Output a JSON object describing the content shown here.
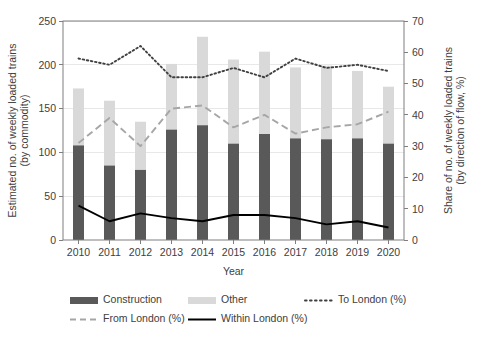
{
  "chart_data": {
    "type": "bar",
    "title": "",
    "subtitle": "",
    "xlabel": "Year",
    "ylabel": "Estimated no. of weekly loaded trains\n(by commodity)",
    "ylabel_line1": "Estimated no. of weekly loaded trains",
    "ylabel_line2": "(by commodity)",
    "y2label_line1": "Share of no. of weekly loaded trains",
    "y2label_line2": "(by direction of flow, %)",
    "categories": [
      "2010",
      "2011",
      "2012",
      "2013",
      "2014",
      "2015",
      "2016",
      "2017",
      "2018",
      "2019",
      "2020"
    ],
    "ylim": [
      0,
      250
    ],
    "yticks": [
      0,
      50,
      100,
      150,
      200,
      250
    ],
    "y2lim": [
      0,
      70
    ],
    "y2ticks": [
      0,
      10,
      20,
      30,
      40,
      50,
      60,
      70
    ],
    "grid": true,
    "legend_position": "bottom",
    "stacked": true,
    "series": [
      {
        "name": "Construction",
        "axis": "left",
        "kind": "bar",
        "color": "#595959",
        "values": [
          108,
          85,
          80,
          126,
          131,
          110,
          121,
          116,
          115,
          116,
          110
        ]
      },
      {
        "name": "Other",
        "axis": "left",
        "kind": "bar",
        "color": "#d9d9d9",
        "values": [
          65,
          74,
          55,
          75,
          101,
          96,
          94,
          81,
          84,
          77,
          65
        ]
      },
      {
        "name": "To London (%)",
        "axis": "right",
        "kind": "line",
        "style": "dotted",
        "color": "#404040",
        "values": [
          58,
          56,
          62,
          52,
          52,
          55,
          52,
          58,
          55,
          56,
          54
        ]
      },
      {
        "name": "From London (%)",
        "axis": "right",
        "kind": "line",
        "style": "dashed",
        "color": "#a6a6a6",
        "values": [
          31,
          39,
          30,
          42,
          43,
          36,
          40,
          34,
          36,
          37,
          41
        ]
      },
      {
        "name": "Within London (%)",
        "axis": "right",
        "kind": "line",
        "style": "solid",
        "color": "#000000",
        "values": [
          11,
          6,
          8.5,
          7,
          6,
          8,
          8,
          7,
          5,
          6,
          4
        ]
      }
    ],
    "totals": [
      173,
      159,
      135,
      201,
      232,
      206,
      215,
      197,
      199,
      193,
      175
    ],
    "legend": [
      {
        "label": "Construction",
        "type": "swatch",
        "color": "#595959"
      },
      {
        "label": "Other",
        "type": "swatch",
        "color": "#d9d9d9"
      },
      {
        "label": "To London (%)",
        "type": "dotted",
        "color": "#404040"
      },
      {
        "label": "From London (%)",
        "type": "dashed",
        "color": "#a6a6a6"
      },
      {
        "label": "Within London (%)",
        "type": "solid",
        "color": "#000000"
      }
    ]
  }
}
